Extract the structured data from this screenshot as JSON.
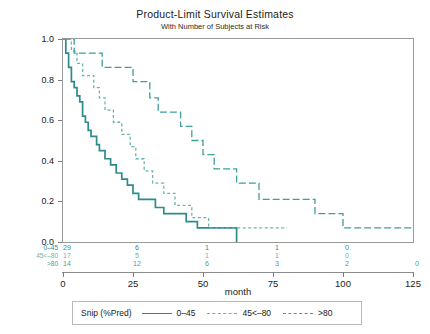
{
  "chart_data": {
    "type": "line",
    "title": "Product-Limit Survival Estimates",
    "subtitle": "With Number of Subjects at Risk",
    "xlabel": "month",
    "ylabel": "Survival Probability",
    "xlim": [
      0,
      125
    ],
    "ylim": [
      0.0,
      1.0
    ],
    "xticks": [
      0,
      25,
      50,
      75,
      100,
      125
    ],
    "xticklabels": [
      "0",
      "25",
      "50",
      "75",
      "100",
      "125"
    ],
    "yticks": [
      0.0,
      0.2,
      0.4,
      0.6,
      0.8,
      1.0
    ],
    "yticklabels": [
      "0.0",
      "0.2",
      "0.4",
      "0.6",
      "0.8",
      "1.0"
    ],
    "grid": false,
    "legend_position": "bottom",
    "legend_title": "Snip (%Pred)",
    "accent_color": "#2e8b8b",
    "series": [
      {
        "name": "0-45",
        "label": "0–45",
        "dash": "solid",
        "color": "#2e8b8b",
        "x": [
          0,
          1,
          2,
          3,
          4,
          5,
          6,
          7,
          8,
          9,
          10,
          12,
          13,
          15,
          17,
          19,
          21,
          23,
          25,
          27,
          30,
          33,
          36,
          40,
          44,
          48,
          52,
          62
        ],
        "y": [
          1.0,
          0.93,
          0.86,
          0.79,
          0.76,
          0.72,
          0.69,
          0.62,
          0.59,
          0.55,
          0.52,
          0.48,
          0.45,
          0.41,
          0.38,
          0.34,
          0.31,
          0.28,
          0.24,
          0.21,
          0.21,
          0.17,
          0.14,
          0.14,
          0.1,
          0.07,
          0.07,
          0.0
        ]
      },
      {
        "name": "45<-80",
        "label": "45<–80",
        "dash": "short",
        "color": "#6bb3b3",
        "x": [
          0,
          3,
          5,
          7,
          9,
          11,
          13,
          15,
          18,
          21,
          24,
          26,
          29,
          32,
          36,
          40,
          46,
          52,
          58,
          65,
          80
        ],
        "y": [
          1.0,
          0.94,
          0.88,
          0.82,
          0.82,
          0.76,
          0.71,
          0.65,
          0.59,
          0.53,
          0.47,
          0.41,
          0.35,
          0.29,
          0.24,
          0.18,
          0.12,
          0.07,
          0.07,
          0.07,
          0.07
        ]
      },
      {
        "name": ">80",
        "label": ">80",
        "dash": "long",
        "color": "#3f9e9e",
        "x": [
          0,
          4,
          9,
          14,
          19,
          25,
          31,
          34,
          38,
          42,
          46,
          50,
          54,
          58,
          62,
          66,
          70,
          75,
          82,
          90,
          100,
          108,
          118,
          125
        ],
        "y": [
          1.0,
          0.93,
          0.93,
          0.86,
          0.86,
          0.79,
          0.71,
          0.64,
          0.64,
          0.57,
          0.5,
          0.43,
          0.36,
          0.36,
          0.29,
          0.29,
          0.21,
          0.21,
          0.21,
          0.14,
          0.07,
          0.07,
          0.07,
          0.07
        ]
      }
    ]
  },
  "risk_table": {
    "times": [
      0,
      25,
      50,
      75,
      100,
      125
    ],
    "rows": [
      {
        "label": "0–45",
        "color": "#2e8b8b",
        "values": [
          "29",
          "6",
          "1",
          "1",
          "0",
          ""
        ]
      },
      {
        "label": "45<–80",
        "color": "#6bb3b3",
        "values": [
          "17",
          "5",
          "1",
          "1",
          "0",
          ""
        ]
      },
      {
        "label": ">80",
        "color": "#3f9e9e",
        "values": [
          "14",
          "12",
          "6",
          "3",
          "2",
          "0"
        ]
      }
    ]
  }
}
